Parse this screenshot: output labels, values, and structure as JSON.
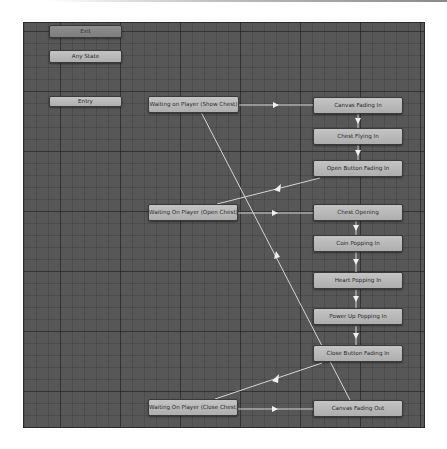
{
  "diagram": {
    "type": "animator-state-machine",
    "colors": {
      "canvas_bg": "#575757",
      "node_fill": "#b8b8b8",
      "exit_fill": "#868686",
      "node_text": "#2a2a2a",
      "transition_line": "#dcdcdc"
    },
    "special_states": {
      "exit": "Exit",
      "any_state": "Any State",
      "entry": "Entry"
    },
    "states": {
      "waiting_show_chest": "Waiting on Player (Show Chest)",
      "waiting_open_chest": "Waiting On Player (Open Chest)",
      "waiting_close_chest": "Waiting On Player (Close Chest)",
      "canvas_fading_in": "Canvas Fading In",
      "chest_flying_in": "Chest Flying In",
      "open_button_fading_in": "Open Button Fading In",
      "chest_opening": "Chest Opening",
      "coin_popping_in": "Coin Popping In",
      "heart_popping_in": "Heart Popping In",
      "power_up_popping_in": "Power Up Popping In",
      "close_button_fading_in": "Close Button Fading In",
      "canvas_fading_out": "Canvas Fading Out"
    },
    "transitions": [
      {
        "from": "Waiting on Player (Show Chest)",
        "to": "Canvas Fading In"
      },
      {
        "from": "Canvas Fading In",
        "to": "Chest Flying In"
      },
      {
        "from": "Chest Flying In",
        "to": "Open Button Fading In"
      },
      {
        "from": "Open Button Fading In",
        "to": "Waiting On Player (Open Chest)"
      },
      {
        "from": "Waiting On Player (Open Chest)",
        "to": "Chest Opening"
      },
      {
        "from": "Chest Opening",
        "to": "Coin Popping In"
      },
      {
        "from": "Coin Popping In",
        "to": "Heart Popping In"
      },
      {
        "from": "Heart Popping In",
        "to": "Power Up Popping In"
      },
      {
        "from": "Power Up Popping In",
        "to": "Close Button Fading In"
      },
      {
        "from": "Close Button Fading In",
        "to": "Waiting On Player (Close Chest)"
      },
      {
        "from": "Waiting On Player (Close Chest)",
        "to": "Canvas Fading Out"
      },
      {
        "from": "Canvas Fading Out",
        "to": "Waiting on Player (Show Chest)"
      }
    ]
  }
}
